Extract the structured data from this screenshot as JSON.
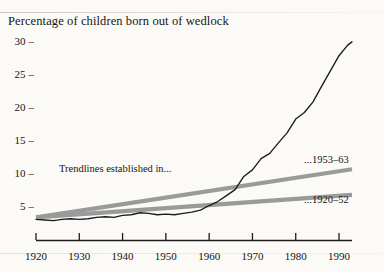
{
  "chart_data": {
    "type": "line",
    "title": "Percentage of children born out of wedlock",
    "xlabel": "",
    "ylabel": "",
    "xlim": [
      1920,
      1993
    ],
    "ylim": [
      0,
      31
    ],
    "grid": false,
    "legend": "none",
    "x_ticks": [
      1920,
      1930,
      1940,
      1950,
      1960,
      1970,
      1980,
      1990
    ],
    "y_ticks": [
      5,
      10,
      15,
      20,
      25,
      30
    ],
    "y_tick_dash": "–",
    "series": [
      {
        "name": "Percentage of children born out of wedlock",
        "kind": "data-line",
        "color": "#1c1c1c",
        "x": [
          1920,
          1922,
          1924,
          1926,
          1928,
          1930,
          1932,
          1934,
          1936,
          1938,
          1940,
          1942,
          1944,
          1946,
          1948,
          1950,
          1952,
          1954,
          1956,
          1958,
          1960,
          1962,
          1964,
          1966,
          1968,
          1970,
          1972,
          1974,
          1976,
          1978,
          1980,
          1982,
          1984,
          1986,
          1988,
          1990,
          1992,
          1993
        ],
        "values": [
          3.2,
          3.1,
          3.0,
          3.2,
          3.3,
          3.2,
          3.3,
          3.5,
          3.6,
          3.5,
          3.8,
          3.9,
          4.2,
          4.1,
          3.9,
          4.0,
          3.9,
          4.1,
          4.3,
          4.6,
          5.3,
          5.9,
          6.8,
          7.7,
          9.7,
          10.7,
          12.4,
          13.2,
          14.8,
          16.3,
          18.4,
          19.4,
          21.0,
          23.4,
          25.7,
          28.0,
          29.6,
          30.1
        ],
        "annotation": "Black jagged historical series rising sharply after 1960"
      },
      {
        "name": "...1953–63",
        "kind": "trendline",
        "color": "#9a9a9a",
        "x": [
          1920,
          1993
        ],
        "values": [
          3.5,
          10.8
        ],
        "label": "...1953–63"
      },
      {
        "name": "...1920–52",
        "kind": "trendline",
        "color": "#9a9a9a",
        "x": [
          1920,
          1993
        ],
        "values": [
          3.5,
          6.9
        ],
        "label": "...1920–52"
      }
    ],
    "annotations": [
      {
        "text": "Trendlines established in...",
        "x": 1930,
        "y": 7.6
      }
    ]
  },
  "labels": {
    "trendlines_note": "Trendlines established in...",
    "upper_trend": "...1953–63",
    "lower_trend": "...1920–52"
  }
}
